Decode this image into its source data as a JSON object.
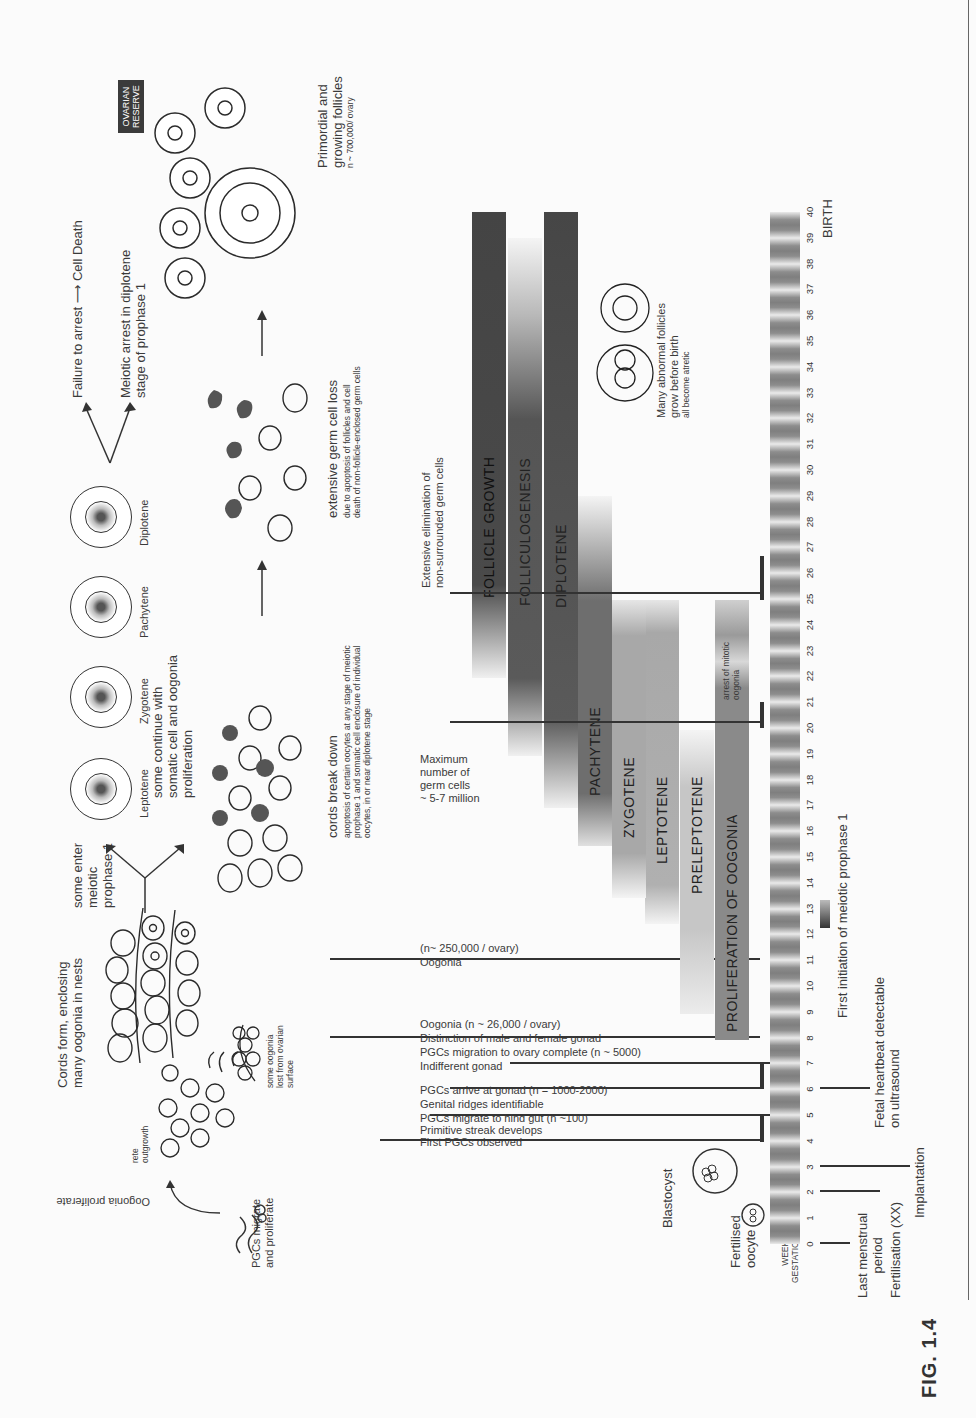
{
  "figure": {
    "label": "FIG. 1.4",
    "orientation": "rotated 90 degrees counter-clockwise on page"
  },
  "axis": {
    "title_line1": "WEEKS",
    "title_line2": "GESTATION",
    "end_label": "BIRTH",
    "weeks": [
      "0",
      "1",
      "2",
      "3",
      "4",
      "5",
      "6",
      "7",
      "8",
      "9",
      "10",
      "11",
      "12",
      "13",
      "14",
      "15",
      "16",
      "17",
      "18",
      "19",
      "20",
      "21",
      "22",
      "23",
      "24",
      "25",
      "26",
      "27",
      "28",
      "29",
      "30",
      "31",
      "32",
      "33",
      "34",
      "35",
      "36",
      "37",
      "38",
      "39",
      "40"
    ]
  },
  "maternal_events": {
    "last_menstrual_line1": "Last menstrual",
    "last_menstrual_line2": "period",
    "fertilisation": "Fertilisation (XX)",
    "implantation": "Implantation",
    "heartbeat_line1": "Fetal heartbeat detectable",
    "heartbeat_line2": "on ultrasound",
    "meiosis_initiation": "First initiation of meiotic prophase 1"
  },
  "early_stage_labels": {
    "fertilised_line1": "Fertilised",
    "fertilised_line2": "oocyte",
    "blastocyst": "Blastocyst"
  },
  "gonad_events": [
    {
      "week": 4,
      "text": "First PGCs observed"
    },
    {
      "week": 4.5,
      "text": "Primitive streak develops"
    },
    {
      "week": 5,
      "text": "PGCs migrate to hind gut (n ~100)"
    },
    {
      "week": 5.5,
      "text": "Genital ridges identifiable"
    },
    {
      "week": 6,
      "text": "PGCs arrive at gonad (n = 1000-2000)"
    },
    {
      "week": 7,
      "text": "Indifferent gonad"
    },
    {
      "week": 7.5,
      "text": "PGCs migration to ovary complete (n ~ 5000)"
    },
    {
      "week": 8,
      "text": "Distinction of male and female gonad"
    },
    {
      "week": 8.4,
      "text": "Oogonia (n ~ 26,000 / ovary)"
    },
    {
      "week": 11,
      "text": "Oogonia"
    },
    {
      "week": 11.4,
      "text": "(n~ 250,000 / ovary)"
    }
  ],
  "max_germ_cells": {
    "line1": "Maximum",
    "line2": "number of",
    "line3": "germ cells",
    "line4": "~ 5-7 million"
  },
  "elimination": {
    "line1": "Extensive elimination of",
    "line2": "non-surrounded germ cells"
  },
  "bars": [
    {
      "label": "PROLIFERATION OF OOGONIA",
      "start": 8,
      "end": 25,
      "note_line1": "arrest of mitotic",
      "note_line2": "oogonia"
    },
    {
      "label": "PRELEPTOTENE",
      "start": 9,
      "end": 20
    },
    {
      "label": "LEPTOTENE",
      "start": 12.5,
      "end": 25
    },
    {
      "label": "ZYGOTENE",
      "start": 13.5,
      "end": 25
    },
    {
      "label": "PACHYTENE",
      "start": 15.5,
      "end": 29
    },
    {
      "label": "DIPLOTENE",
      "start": 17,
      "end": 40
    },
    {
      "label": "FOLLICULOGENESIS",
      "start": 19,
      "end": 39
    },
    {
      "label": "FOLLICLE GROWTH",
      "start": 22,
      "end": 40
    }
  ],
  "abnormal_follicles": {
    "line1": "Many abnormal follicles",
    "line2": "grow before birth",
    "line3": "all become atretic"
  },
  "development_panel": {
    "pgcs": {
      "line1": "PGCs migrate",
      "line2": "and proliferate"
    },
    "oogonia_proliferate": "Oogonia proliferate",
    "rete_line1": "rete",
    "rete_line2": "outgrowth",
    "cords": {
      "line1": "Cords form, enclosing",
      "line2": "many oogonia in nests"
    },
    "lost": {
      "line1": "some oogonia",
      "line2": "lost from ovarian",
      "line3": "surface"
    },
    "enter_meiosis": {
      "line1": "some enter",
      "line2": "meiotic",
      "line3": "prophase 1"
    },
    "continue": {
      "line1": "some continue with",
      "line2": "somatic cell and oogonia",
      "line3": "proliferation"
    },
    "cords_break": {
      "title": "cords break down",
      "line1": "apoptosis of certain oocytes at any stage of meiotic",
      "line2": "prophase 1 and somatic cell enclosure of individual",
      "line3": "oocytes, in or near diplotene stage"
    },
    "stages": [
      "Leptotene",
      "Zygotene",
      "Pachytene",
      "Diplotene"
    ],
    "germ_loss": {
      "title": "extensive germ cell loss",
      "line1": "due to apoptosis of follicles and cell",
      "line2": "death of non-follicle-enclosed germ cells"
    },
    "failure": "Failure to arrest",
    "cell_death": "Cell Death",
    "arrest": {
      "line1": "Meiotic arrest in diplotene",
      "line2": "stage of prophase 1"
    },
    "reserve": {
      "line1": "OVARIAN",
      "line2": "RESERVE"
    },
    "primordial": {
      "line1": "Primordial and",
      "line2": "growing follicles",
      "line3": "n ~ 700,000/ ovary"
    }
  }
}
